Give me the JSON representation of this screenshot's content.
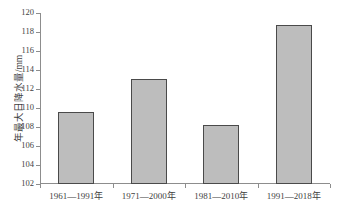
{
  "chart_data": {
    "type": "bar",
    "title": "",
    "xlabel": "",
    "ylabel": "年最大日降水量/mm",
    "categories": [
      "1961—1991年",
      "1971—2000年",
      "1981—2010年",
      "1991—2018年"
    ],
    "values": [
      109.6,
      113.1,
      108.2,
      118.7
    ],
    "ylim": [
      102,
      120
    ],
    "ytick_step": 2,
    "yticks": [
      102,
      104,
      106,
      108,
      110,
      112,
      114,
      116,
      118,
      120
    ],
    "ytick_labels": [
      "102",
      "104",
      "106",
      "108",
      "110",
      "112",
      "114",
      "116",
      "118",
      "120"
    ],
    "grid": false,
    "legend": null,
    "legend_position": "none",
    "series": [
      {
        "name": "年最大日降水量",
        "values": [
          109.6,
          113.1,
          108.2,
          118.7
        ]
      }
    ],
    "colors": {
      "bar_fill": "#bdbdbd",
      "bar_border": "#4a4a4a",
      "axis": "#8d8d8d",
      "text": "#3f3f3f",
      "background": "#ffffff"
    }
  }
}
